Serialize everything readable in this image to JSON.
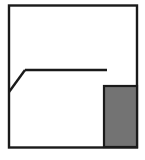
{
  "figure": {
    "type": "line-drawing",
    "canvas": {
      "width": 145,
      "height": 160,
      "background": "#ffffff"
    },
    "colors": {
      "stroke": "#1a1a1a",
      "fill_gray": "#737373",
      "fill_white": "#ffffff",
      "divider": "#2b2b2b"
    },
    "stroke_widths": {
      "frame": 2.4,
      "roof": 2.4,
      "tower": 2.2,
      "dashed": 1.8,
      "divider": 1.8
    },
    "shapes": {
      "outer_frame": {
        "name": "outer-frame",
        "kind": "rectangle",
        "x": 9,
        "y": 5.5,
        "width": 128,
        "height": 142,
        "fill": "#ffffff",
        "stroke": "#1a1a1a"
      },
      "roof_slope_left": {
        "name": "roof-slope-left",
        "kind": "polyline",
        "points": "9,92 25,70"
      },
      "roof_ridge": {
        "name": "roof-ridge",
        "kind": "polyline",
        "points": "25,70 107,70"
      },
      "tower_roof_left": {
        "name": "tower-roof-left-slope",
        "kind": "polyline",
        "points": "104,86 120,68"
      },
      "tower_roof_right": {
        "name": "tower-roof-right-slope",
        "kind": "polyline",
        "points": "120,68 137,86"
      },
      "tower_body": {
        "name": "tower-body",
        "kind": "rectangle",
        "x": 104,
        "y": 86,
        "width": 33,
        "height": 61,
        "fill": "#737373",
        "stroke": "#1a1a1a"
      },
      "tower_divider": {
        "name": "tower-vertical-divider",
        "kind": "polyline",
        "points": "120,86 120,147"
      },
      "dashed_guide": {
        "name": "dashed-guide-line",
        "kind": "polyline",
        "points": "25,71 25,147",
        "dash": "6 4"
      },
      "ridge_to_tower": {
        "name": "ridge-to-tower-eave",
        "kind": "polyline",
        "points": "107,70 107,70"
      }
    },
    "labels": {
      "outer_frame": "Outer wall frame",
      "roof": "Main roof line",
      "tower": "Shaded tower block",
      "dashed": "Hidden edge guide"
    }
  }
}
